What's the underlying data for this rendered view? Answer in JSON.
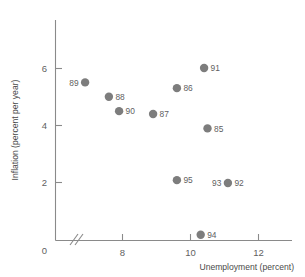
{
  "chart_data": {
    "type": "scatter",
    "title": "",
    "xlabel": "Unemployment (percent)",
    "ylabel": "Inflation (percent per year)",
    "xlim": [
      0,
      13.2
    ],
    "ylim": [
      0,
      7.2
    ],
    "xticks": [
      0,
      8,
      10,
      12
    ],
    "xtick_labels": [
      "0",
      "8",
      "10",
      "12"
    ],
    "yticks": [
      0,
      2,
      4,
      6
    ],
    "ytick_labels": [
      "0",
      "2",
      "4",
      "6"
    ],
    "grid": false,
    "legend": "none",
    "axis_break": {
      "axis": "x",
      "between": [
        0,
        8
      ],
      "symbol": "//"
    },
    "marker_color": "#7d7d7d",
    "axis_color": "#8a8a8a",
    "points": [
      {
        "label": "89",
        "x": 6.9,
        "y": 5.5,
        "label_side": "left"
      },
      {
        "label": "88",
        "x": 7.6,
        "y": 5.0,
        "label_side": "right"
      },
      {
        "label": "90",
        "x": 7.9,
        "y": 4.5,
        "label_side": "right"
      },
      {
        "label": "87",
        "x": 8.9,
        "y": 4.4,
        "label_side": "right"
      },
      {
        "label": "86",
        "x": 9.6,
        "y": 5.3,
        "label_side": "right"
      },
      {
        "label": "91",
        "x": 10.4,
        "y": 6.0,
        "label_side": "right"
      },
      {
        "label": "85",
        "x": 10.5,
        "y": 3.9,
        "label_side": "right"
      },
      {
        "label": "95",
        "x": 9.6,
        "y": 2.1,
        "label_side": "right"
      },
      {
        "label": "93",
        "x": 11.1,
        "y": 2.0,
        "label_side": "left"
      },
      {
        "label": "92",
        "x": 11.1,
        "y": 2.0,
        "label_side": "right"
      },
      {
        "label": "94",
        "x": 10.3,
        "y": 0.2,
        "label_side": "right"
      }
    ]
  },
  "axes": {
    "x_title": "Unemployment (percent)",
    "y_title": "Inflation (percent per year)",
    "x_tick_0": "0",
    "x_tick_8": "8",
    "x_tick_10": "10",
    "x_tick_12": "12",
    "y_tick_0": "0",
    "y_tick_2": "2",
    "y_tick_4": "4",
    "y_tick_6": "6"
  }
}
